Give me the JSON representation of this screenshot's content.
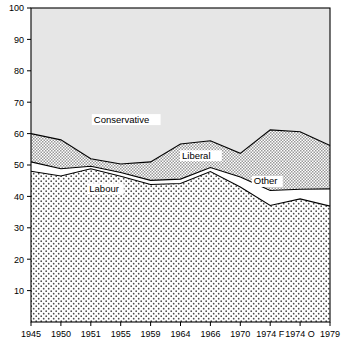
{
  "chart_data": {
    "type": "area",
    "stacked": true,
    "title": "",
    "subtitle": "",
    "xlabel": "",
    "ylabel": "",
    "grid": false,
    "legend_position": "inline-annotations",
    "ylim": [
      0,
      100
    ],
    "yticks": [
      10,
      20,
      30,
      40,
      50,
      60,
      70,
      80,
      90,
      100
    ],
    "categories": [
      "1945",
      "1950",
      "1951",
      "1955",
      "1959",
      "1964",
      "1966",
      "1970",
      "1974 F",
      "1974 O",
      "1979"
    ],
    "series": [
      {
        "name": "Labour",
        "fill": "dotted",
        "values": [
          48.0,
          46.5,
          48.8,
          46.4,
          43.8,
          44.1,
          47.9,
          43.0,
          37.1,
          39.2,
          36.9
        ]
      },
      {
        "name": "Other",
        "fill": "white",
        "values": [
          3.0,
          2.3,
          0.8,
          1.2,
          1.3,
          1.4,
          1.3,
          3.2,
          4.8,
          3.1,
          5.5
        ]
      },
      {
        "name": "Liberal",
        "fill": "crosshatch",
        "values": [
          9.0,
          9.2,
          2.4,
          2.7,
          5.9,
          11.2,
          8.5,
          7.5,
          19.3,
          18.3,
          13.8
        ]
      },
      {
        "name": "Conservative",
        "fill": "light-gray",
        "values": [
          40.0,
          42.0,
          48.0,
          49.7,
          49.0,
          43.3,
          42.3,
          46.3,
          38.8,
          39.4,
          43.8
        ]
      }
    ],
    "cumulative_boundaries": {
      "labour_top": [
        48.0,
        46.5,
        48.8,
        46.4,
        43.8,
        44.1,
        47.9,
        43.0,
        37.1,
        39.2,
        36.9
      ],
      "other_top": [
        51.0,
        48.8,
        49.6,
        47.6,
        45.1,
        45.5,
        49.2,
        46.2,
        41.9,
        42.3,
        42.4
      ],
      "liberal_top": [
        60.0,
        58.0,
        52.0,
        50.3,
        51.0,
        56.7,
        57.7,
        53.7,
        61.2,
        60.6,
        56.2
      ],
      "conservative_top": [
        100,
        100,
        100,
        100,
        100,
        100,
        100,
        100,
        100,
        100,
        100
      ]
    },
    "annotations": [
      {
        "label": "Conservative",
        "x_frac": 0.21,
        "y_value": 63.5
      },
      {
        "label": "Liberal",
        "x_frac": 0.505,
        "y_value": 52.0
      },
      {
        "label": "Labour",
        "x_frac": 0.195,
        "y_value": 41.5
      },
      {
        "label": "Other",
        "x_frac": 0.745,
        "y_value": 43.8
      }
    ],
    "colors": {
      "conservative": "#e3e3e3",
      "liberal": "#d2d2d2",
      "other": "#ffffff",
      "labour": "#f2f2f2",
      "axis": "#000000",
      "line": "#000000"
    }
  }
}
